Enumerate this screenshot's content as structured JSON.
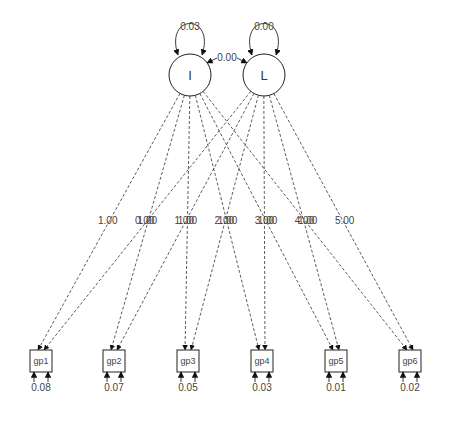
{
  "diagram": {
    "type": "sem-path-diagram",
    "latents": [
      {
        "id": "I",
        "label": "I",
        "variance": "0.03",
        "cx": 190,
        "cy": 75
      },
      {
        "id": "L",
        "label": "L",
        "variance": "0.00",
        "cx": 264,
        "cy": 75
      }
    ],
    "covariance": {
      "from": "I",
      "to": "L",
      "label": "0.00"
    },
    "observed": [
      {
        "id": "gp1",
        "label": "gp1",
        "residual": "0.08",
        "x": 41
      },
      {
        "id": "gp2",
        "label": "gp2",
        "residual": "0.07",
        "x": 114
      },
      {
        "id": "gp3",
        "label": "gp3",
        "residual": "0.05",
        "x": 188
      },
      {
        "id": "gp4",
        "label": "gp4",
        "residual": "0.03",
        "x": 262
      },
      {
        "id": "gp5",
        "label": "gp5",
        "residual": "0.01",
        "x": 336
      },
      {
        "id": "gp6",
        "label": "gp6",
        "residual": "0.02",
        "x": 410
      }
    ],
    "loadings_I": [
      "1.00",
      "1.00",
      "1.00",
      "1.00",
      "1.00",
      "1.00"
    ],
    "loadings_L": [
      "0.00",
      "1.00",
      "2.00",
      "3.00",
      "4.00",
      "5.00"
    ]
  }
}
